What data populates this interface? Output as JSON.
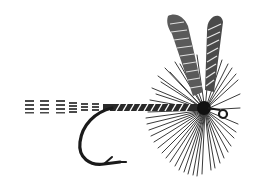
{
  "image": {
    "subject": "Fishing fly illustration",
    "description": "Black and white engraving of a dry fishing fly with striped upright wings, radial hackle, segmented tail and a curved hook",
    "colors": {
      "background": "#ffffff",
      "ink": "#1a1a1a",
      "ink_mid": "#3a3a3a",
      "ink_light": "#6a6a6a"
    },
    "parts": [
      {
        "name": "tail",
        "label": "Tail"
      },
      {
        "name": "body",
        "label": "Body"
      },
      {
        "name": "hook",
        "label": "Hook"
      },
      {
        "name": "hackle",
        "label": "Hackle"
      },
      {
        "name": "wings",
        "label": "Wings"
      },
      {
        "name": "eye",
        "label": "Hook eye"
      }
    ]
  }
}
